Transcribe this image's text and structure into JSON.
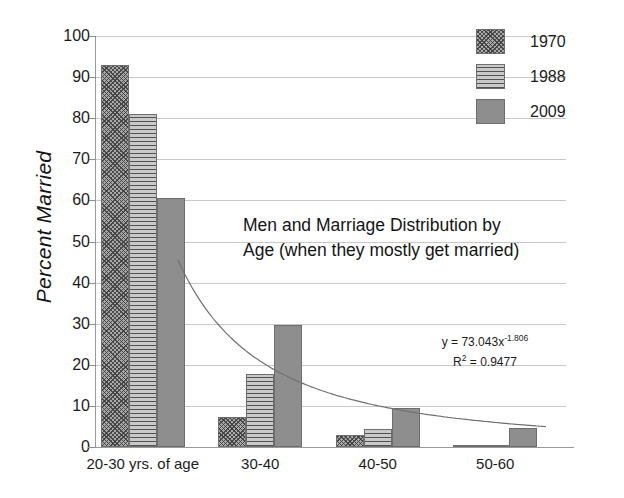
{
  "chart_data": {
    "type": "bar",
    "title": "Men and Marriage Distribution by Age (when they mostly get married)",
    "title_lines": [
      "Men and Marriage Distribution by",
      "Age (when they mostly get married)"
    ],
    "xlabel": "",
    "ylabel": "Percent Married",
    "ylim": [
      0,
      100
    ],
    "ytick_step": 10,
    "yticks": [
      100,
      90,
      80,
      70,
      60,
      50,
      40,
      30,
      20,
      10,
      0
    ],
    "grid": true,
    "legend_position": "top-right",
    "categories": [
      "20-30 yrs. of age",
      "30-40",
      "40-50",
      "50-60"
    ],
    "series": [
      {
        "name": "1970",
        "values": [
          93.0,
          7.3,
          3.0,
          0.3
        ],
        "pattern": "diagonal-crosshatch",
        "color": "#a8a8a8"
      },
      {
        "name": "1988",
        "values": [
          81.0,
          17.7,
          4.3,
          0.3
        ],
        "pattern": "horizontal-lines",
        "color": "#c9c9c9"
      },
      {
        "name": "2009",
        "values": [
          60.7,
          29.8,
          9.4,
          4.6
        ],
        "pattern": "solid",
        "color": "#8e8e8e"
      }
    ],
    "trendline": {
      "type": "power",
      "equation": "y = 73.043x",
      "equation_exponent": "-1.806",
      "r_squared_label": "R",
      "r_squared_sup": "2",
      "r_squared_value": " = 0.9477",
      "coefficient": 73.043,
      "exponent": -1.806,
      "r_squared": 0.9477,
      "color": "#707070"
    }
  },
  "legend": {
    "items": [
      {
        "label": "1970"
      },
      {
        "label": "1988"
      },
      {
        "label": "2009"
      }
    ]
  },
  "colors": {
    "background": "#ffffff",
    "gridline": "#c8c8c8",
    "axis": "#9a9a9a",
    "text": "#1a1a1a",
    "series_1970": "#a8a8a8",
    "series_1988": "#c9c9c9",
    "series_2009": "#8e8e8e",
    "trendline": "#707070"
  }
}
